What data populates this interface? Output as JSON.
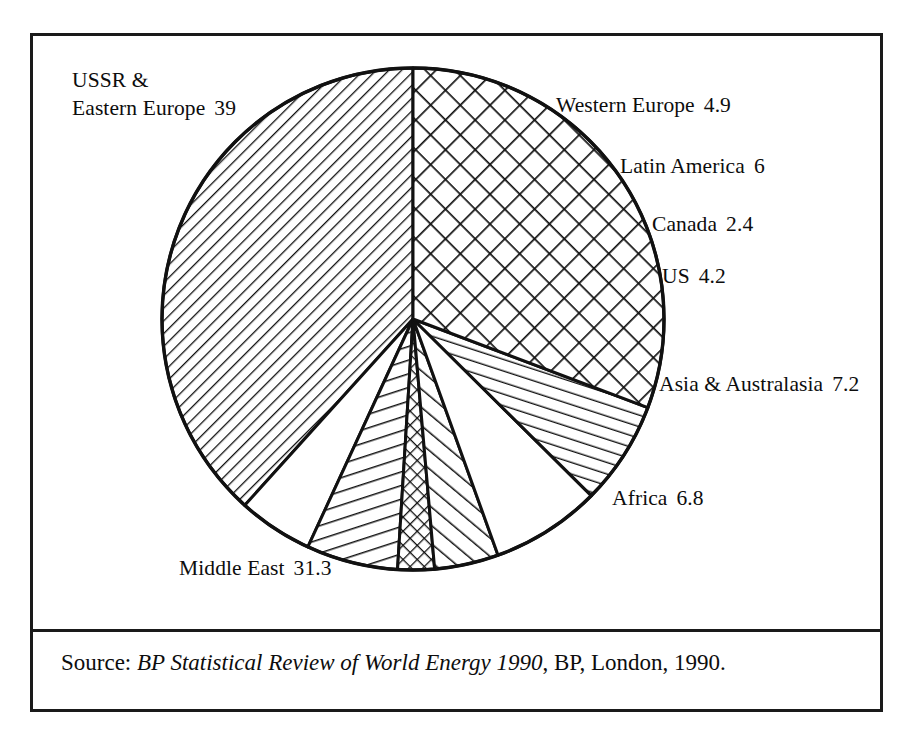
{
  "figure": {
    "source_prefix": "Source:",
    "source_title": "BP Statistical Review of World Energy 1990",
    "source_suffix": ", BP, London, 1990."
  },
  "chart_data": {
    "type": "pie",
    "title": "",
    "unit": "percent of world proved oil reserves",
    "total": 101.8,
    "center": [
      413,
      319
    ],
    "radius": 251,
    "start_angle_deg": -90,
    "direction": "counterclockwise",
    "legend": "labels placed outside slices",
    "categories": [
      "USSR & Eastern Europe",
      "Middle East",
      "Africa",
      "Asia & Australasia",
      "US",
      "Canada",
      "Latin America",
      "Western Europe"
    ],
    "values": [
      39,
      31.3,
      6.8,
      7.2,
      4.2,
      2.4,
      6,
      4.9
    ],
    "slices": [
      {
        "label": "USSR & Eastern Europe",
        "label_line1": "USSR &",
        "label_line2": "Eastern Europe",
        "value": "39",
        "numeric": 39,
        "fill": "hatch-forward-fine"
      },
      {
        "label": "Western Europe",
        "value": "4.9",
        "numeric": 4.9,
        "fill": "none"
      },
      {
        "label": "Latin America",
        "value": "6",
        "numeric": 6,
        "fill": "hatch-steep-forward"
      },
      {
        "label": "Canada",
        "value": "2.4",
        "numeric": 2.4,
        "fill": "crosshatch-fine"
      },
      {
        "label": "US",
        "value": "4.2",
        "numeric": 4.2,
        "fill": "hatch-back-medium"
      },
      {
        "label": "Asia & Australasia",
        "value": "7.2",
        "numeric": 7.2,
        "fill": "none"
      },
      {
        "label": "Africa",
        "value": "6.8",
        "numeric": 6.8,
        "fill": "hatch-steep-back"
      },
      {
        "label": "Middle East",
        "value": "31.3",
        "numeric": 31.3,
        "fill": "crosshatch-coarse"
      }
    ],
    "colors": {
      "stroke": "#111111",
      "background": "#ffffff"
    }
  }
}
